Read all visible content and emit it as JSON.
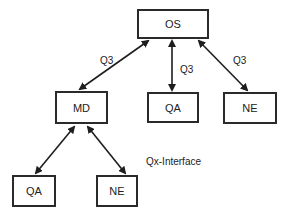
{
  "nodes": {
    "os": "OS",
    "md": "MD",
    "qa_top": "QA",
    "ne_top": "NE",
    "qa_bottom": "QA",
    "ne_bottom": "NE"
  },
  "edge_labels": {
    "os_md": "Q3",
    "os_qa": "Q3",
    "os_ne": "Q3",
    "interface": "Qx-Interface"
  },
  "colors": {
    "line": "#1e1e1e",
    "box_border": "#2a2a2a",
    "background": "#ffffff"
  }
}
